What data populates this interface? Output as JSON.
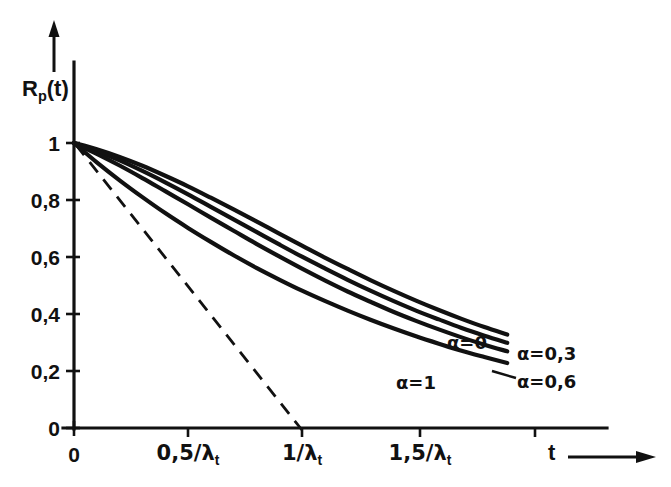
{
  "chart_data": {
    "type": "line",
    "title": "",
    "subtitle": "",
    "xlabel": "t",
    "ylabel": "R_p(t)",
    "ylabel_base": "R",
    "ylabel_sub": "p",
    "ylabel_tail": "(t)",
    "xlabel_arrow": "→",
    "xlim": [
      0,
      2.35
    ],
    "ylim": [
      0,
      1.12
    ],
    "grid": false,
    "legend_position": "inline-right-of-curve-ends",
    "x_tick_values": [
      0,
      0.5,
      1.0,
      1.5,
      2.0
    ],
    "x_tick_labels": [
      "0",
      "0,5/λ",
      "1/λ",
      "1,5/λ",
      ""
    ],
    "x_tick_label_sub": "t",
    "y_tick_values": [
      0,
      0.2,
      0.4,
      0.6,
      0.8,
      1.0
    ],
    "y_tick_labels": [
      "0",
      "0,2",
      "0,4",
      "0,6",
      "0,8",
      "1"
    ],
    "tangent_line": {
      "name": "tangent at origin",
      "style": "dashed",
      "from": [
        0,
        1.0
      ],
      "to": [
        1.0,
        0.0
      ]
    },
    "series": [
      {
        "name": "α=0",
        "label": "α=0",
        "alpha": 0,
        "x": [
          0.0,
          0.1,
          0.2,
          0.3,
          0.4,
          0.5,
          0.6,
          0.7,
          0.8,
          0.9,
          1.0,
          1.1,
          1.2,
          1.3,
          1.4,
          1.5,
          1.6,
          1.7,
          1.8,
          1.9
        ],
        "y": [
          1.0,
          0.978,
          0.951,
          0.92,
          0.885,
          0.848,
          0.808,
          0.767,
          0.725,
          0.682,
          0.64,
          0.598,
          0.558,
          0.519,
          0.482,
          0.447,
          0.414,
          0.383,
          0.354,
          0.328
        ]
      },
      {
        "name": "α=0,3",
        "label": "α=0,3",
        "alpha": 0.3,
        "x": [
          0.0,
          0.1,
          0.2,
          0.3,
          0.4,
          0.5,
          0.6,
          0.7,
          0.8,
          0.9,
          1.0,
          1.1,
          1.2,
          1.3,
          1.4,
          1.5,
          1.6,
          1.7,
          1.8,
          1.9
        ],
        "y": [
          1.0,
          0.972,
          0.939,
          0.902,
          0.862,
          0.82,
          0.776,
          0.732,
          0.688,
          0.644,
          0.601,
          0.56,
          0.52,
          0.482,
          0.446,
          0.412,
          0.381,
          0.351,
          0.324,
          0.299
        ]
      },
      {
        "name": "α=0,6",
        "label": "α=0,6",
        "alpha": 0.6,
        "x": [
          0.0,
          0.1,
          0.2,
          0.3,
          0.4,
          0.5,
          0.6,
          0.7,
          0.8,
          0.9,
          1.0,
          1.1,
          1.2,
          1.3,
          1.4,
          1.5,
          1.6,
          1.7,
          1.8,
          1.9
        ],
        "y": [
          1.0,
          0.962,
          0.921,
          0.877,
          0.831,
          0.785,
          0.738,
          0.692,
          0.646,
          0.602,
          0.559,
          0.518,
          0.479,
          0.443,
          0.408,
          0.376,
          0.346,
          0.318,
          0.292,
          0.269
        ]
      },
      {
        "name": "α=1",
        "label": "α=1",
        "alpha": 1,
        "x": [
          0.0,
          0.1,
          0.2,
          0.3,
          0.4,
          0.5,
          0.6,
          0.7,
          0.8,
          0.9,
          1.0,
          1.1,
          1.2,
          1.3,
          1.4,
          1.5,
          1.6,
          1.7,
          1.8,
          1.9
        ],
        "y": [
          1.0,
          0.932,
          0.869,
          0.81,
          0.754,
          0.702,
          0.653,
          0.606,
          0.562,
          0.521,
          0.482,
          0.446,
          0.412,
          0.38,
          0.35,
          0.322,
          0.296,
          0.271,
          0.249,
          0.228
        ]
      }
    ],
    "annotations": [
      {
        "text": "α=0",
        "x": 1.58,
        "y": 0.425
      },
      {
        "text": "α=0,3",
        "x": 1.97,
        "y": 0.295
      },
      {
        "text": "α=0,6",
        "x": 1.97,
        "y": 0.215
      },
      {
        "text": "α=1",
        "x": 1.4,
        "y": 0.185
      }
    ]
  },
  "axes": {
    "y_title_base": "R",
    "y_title_sub": "p",
    "y_title_tail": "(t)",
    "x_title": "t",
    "y_ticks": [
      {
        "label": "1",
        "value": 1.0
      },
      {
        "label": "0,8",
        "value": 0.8
      },
      {
        "label": "0,6",
        "value": 0.6
      },
      {
        "label": "0,4",
        "value": 0.4
      },
      {
        "label": "0,2",
        "value": 0.2
      },
      {
        "label": "0",
        "value": 0.0
      }
    ],
    "x_ticks": [
      {
        "label": "0",
        "sub": "",
        "value": 0.0
      },
      {
        "label": "0,5/λ",
        "sub": "t",
        "value": 0.5
      },
      {
        "label": "1/λ",
        "sub": "t",
        "value": 1.0
      },
      {
        "label": "1,5/λ",
        "sub": "t",
        "value": 1.5
      },
      {
        "label": "",
        "sub": "",
        "value": 2.0
      }
    ]
  },
  "curve_labels": {
    "a0": "α=0",
    "a03": "α=0,3",
    "a06": "α=0,6",
    "a1": "α=1"
  },
  "colors": {
    "ink": "#111111",
    "background": "#ffffff"
  }
}
